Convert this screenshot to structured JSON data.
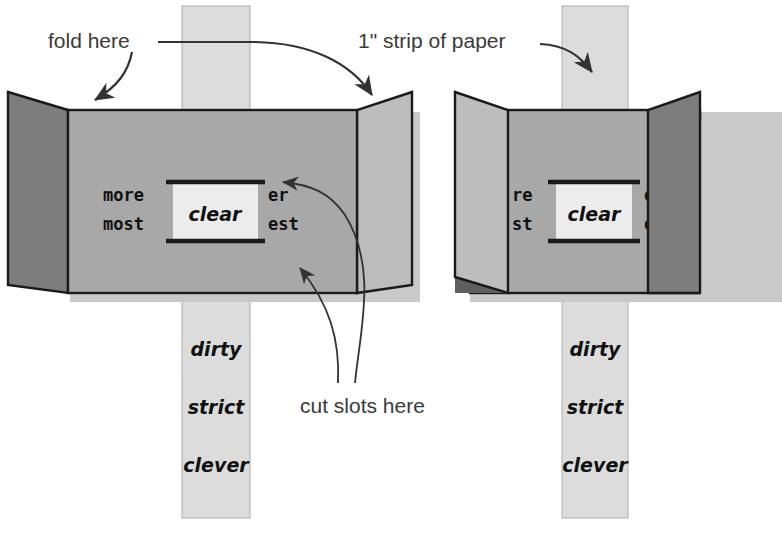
{
  "diagram": {
    "annotations": {
      "fold_here": "fold here",
      "strip_of_paper": "1\" strip of paper",
      "cut_slots_here": "cut slots here"
    },
    "colors": {
      "background": "#ffffff",
      "panel_face": "#a8a8a8",
      "flap_dark": "#7d7d7d",
      "flap_light": "#bdbdbd",
      "strip_fill": "#dcdcdc",
      "window_fill": "#ececec",
      "shadow": "#c9c9c9",
      "shadow_dark": "#5f5f5f",
      "outline": "#1a1a1a",
      "text": "#111111",
      "label_text": "#3a3a3a"
    },
    "figures": [
      {
        "id": "left-figure",
        "caption_role": "flaps folded open outward",
        "window_word": "clear",
        "left_affixes": [
          "more",
          "most"
        ],
        "right_affixes": [
          "er",
          "est"
        ],
        "strip_words": [
          "dirty",
          "strict",
          "clever"
        ],
        "left_flap_shade": "dark",
        "right_flap_shade": "light"
      },
      {
        "id": "right-figure",
        "caption_role": "flaps folded inward covering affixes",
        "window_word": "clear",
        "left_affixes": [
          "re",
          "st"
        ],
        "right_affixes": [
          "er",
          "es"
        ],
        "strip_words": [
          "dirty",
          "strict",
          "clever"
        ],
        "left_flap_shade": "light",
        "right_flap_shade": "dark"
      }
    ]
  }
}
